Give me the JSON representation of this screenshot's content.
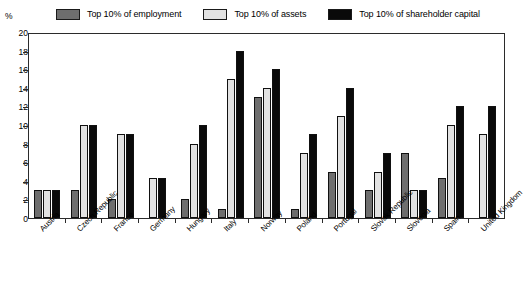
{
  "chart_data": {
    "type": "bar",
    "title": "",
    "xlabel": "",
    "ylabel": "%",
    "ylim": [
      0,
      20
    ],
    "yticks": [
      0,
      2,
      4,
      6,
      8,
      10,
      12,
      14,
      16,
      18,
      20
    ],
    "grid": false,
    "legend_position": "top",
    "categories": [
      "Austria",
      "Czech Republic",
      "France",
      "Germany",
      "Hungary",
      "Italy",
      "Norway",
      "Poland",
      "Portugal",
      "Slovak Republic",
      "Slovenia",
      "Spain",
      "United Kingdom"
    ],
    "series": [
      {
        "name": "Top 10% of employment",
        "color": "#6e6e6e",
        "values": [
          3.0,
          3.0,
          2.0,
          null,
          2.0,
          1.0,
          13.0,
          1.0,
          5.0,
          3.0,
          7.0,
          4.3,
          null
        ]
      },
      {
        "name": "Top 10% of assets",
        "color": "#e2e2e2",
        "values": [
          3.0,
          10.0,
          9.0,
          4.3,
          8.0,
          15.0,
          14.0,
          7.0,
          11.0,
          5.0,
          3.0,
          10.0,
          9.0
        ]
      },
      {
        "name": "Top 10% of shareholder capital",
        "color": "#0a0a0a",
        "values": [
          3.0,
          10.0,
          9.0,
          4.3,
          10.0,
          18.0,
          16.0,
          9.0,
          14.0,
          7.0,
          3.0,
          12.0,
          12.0
        ]
      }
    ]
  },
  "legend": {
    "items": [
      {
        "label": "Top 10% of employment",
        "swatch": "#6e6e6e"
      },
      {
        "label": "Top 10% of assets",
        "swatch": "#e2e2e2"
      },
      {
        "label": "Top 10% of shareholder capital",
        "swatch": "#0a0a0a"
      }
    ]
  },
  "axis": {
    "unit": "%"
  },
  "colors": {
    "employment": "#6e6e6e",
    "assets": "#e2e2e2",
    "capital": "#0a0a0a",
    "frame": "#2b2b2b",
    "background": "#ffffff"
  }
}
